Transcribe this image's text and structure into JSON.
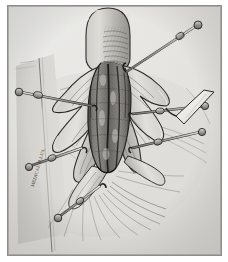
{
  "figure": {
    "domain": "medical-surgical-illustration",
    "title": "Surgical exposure of digit with skin hook retraction",
    "medium": "graphite and ink line drawing, grayscale halftone",
    "orientation": "portrait",
    "frame": {
      "border_color": "#8d8d8a",
      "background_color": "#e8e8e6",
      "page_color": "#ffffff",
      "width_px": 213,
      "height_px": 249
    },
    "palette": {
      "paper": "#e8e8e6",
      "mid_tone": "#b9b8b4",
      "shadow": "#8a8884",
      "deep_shadow": "#4e4c49",
      "ink": "#2b2a28",
      "highlight": "#f2f1ef",
      "instrument_metal": "#9c9a96",
      "blade_highlight": "#fbfaf8",
      "wound_tissue": "#7f7d79"
    },
    "signature": {
      "text": "MEDICAL ILLUS.",
      "visible": true,
      "position": "lower-left, rotated vertical",
      "legible": false
    },
    "anatomy": [
      {
        "name": "distal-digit",
        "label": "digit tip / thumb pulp",
        "location": "top-center",
        "shading": "cross-hatch along ulnar aspect"
      },
      {
        "name": "surgical-wound",
        "label": "longitudinal open wound",
        "location": "center",
        "shading": "mottled granular tissue with dark linear striations"
      },
      {
        "name": "skin-flap-left",
        "label": "reflected skin flap, radial side",
        "location": "center-left"
      },
      {
        "name": "skin-flap-right",
        "label": "reflected skin flap, ulnar side",
        "location": "center-right"
      },
      {
        "name": "palmar-surface",
        "label": "surrounding palmar skin with radiating creases",
        "location": "lower half"
      },
      {
        "name": "surgical-drape",
        "label": "drape / towel edge",
        "location": "left vertical band"
      }
    ],
    "instruments": [
      {
        "name": "skin-hook-upper-right",
        "label": "single-prong skin hook",
        "count": 1,
        "direction": "upper right, 35 degrees"
      },
      {
        "name": "skin-hook-left",
        "label": "single-prong skin hook",
        "count": 1,
        "direction": "left, horizontal"
      },
      {
        "name": "skin-hook-mid-right",
        "label": "single-prong skin hook",
        "count": 1,
        "direction": "right"
      },
      {
        "name": "skin-hook-lower-right",
        "label": "single-prong skin hook",
        "count": 1,
        "direction": "lower right"
      },
      {
        "name": "skin-hook-lower-left",
        "label": "single-prong skin hook",
        "count": 1,
        "direction": "lower left"
      },
      {
        "name": "skin-hook-bottom",
        "label": "single-prong skin hook",
        "count": 1,
        "direction": "bottom"
      },
      {
        "name": "retractor-blade",
        "label": "small flat retractor blade",
        "count": 1,
        "direction": "right margin, white highlight"
      }
    ],
    "hook_count_total": 6
  }
}
